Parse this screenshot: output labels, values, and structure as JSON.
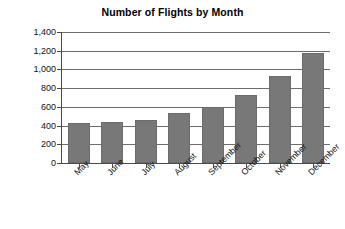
{
  "chart_data": {
    "type": "bar",
    "title": "Number of Flights by Month",
    "xlabel": "",
    "ylabel": "",
    "categories": [
      "May",
      "June",
      "July",
      "August",
      "September",
      "October",
      "November",
      "December"
    ],
    "values": [
      430,
      435,
      465,
      530,
      600,
      730,
      930,
      1180
    ],
    "ylim": [
      0,
      1400
    ],
    "ytick_labels": [
      "0",
      "200",
      "400",
      "600",
      "800",
      "1,000",
      "1,200",
      "1,400"
    ],
    "ytick_values": [
      0,
      200,
      400,
      600,
      800,
      1000,
      1200,
      1400
    ],
    "grid": true,
    "legend": null,
    "series_color": "#787878",
    "axis_color": "#4a4a4a",
    "background": "#ffffff"
  }
}
